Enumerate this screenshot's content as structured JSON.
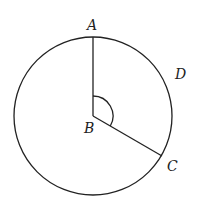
{
  "diagram": {
    "type": "circle-geometry",
    "colors": {
      "stroke": "#222222",
      "background": "#ffffff"
    },
    "circle": {
      "center_label": "B",
      "cx": 93,
      "cy": 116,
      "r": 79
    },
    "points": [
      {
        "id": "A",
        "label": "A",
        "x": 93,
        "y": 37,
        "label_x": 87,
        "label_y": 30
      },
      {
        "id": "B",
        "label": "B",
        "x": 93,
        "y": 116,
        "label_x": 85,
        "label_y": 133
      },
      {
        "id": "C",
        "label": "C",
        "x": 162,
        "y": 156,
        "label_x": 167,
        "label_y": 171
      },
      {
        "id": "D",
        "label": "D",
        "x": 172,
        "y": 80,
        "label_x": 175,
        "label_y": 79
      }
    ],
    "segments": [
      {
        "from": "B",
        "to": "A",
        "name": "radius-BA"
      },
      {
        "from": "B",
        "to": "C",
        "name": "radius-BC"
      }
    ],
    "angle_marker": {
      "vertex": "B",
      "between": [
        "A",
        "C"
      ],
      "radius": 20
    }
  }
}
